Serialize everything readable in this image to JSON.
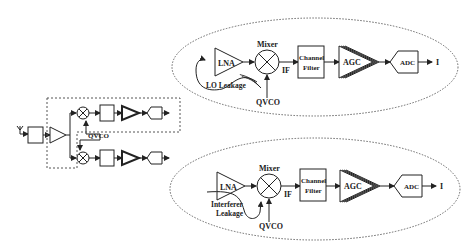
{
  "overview": {
    "vco_label": "QVCO"
  },
  "top_detail": {
    "lna_label": "LNA",
    "mixer_label": "Mixer",
    "if_label": "IF",
    "filter_label_1": "Channel",
    "filter_label_2": "Filter",
    "agc_label": "AGC",
    "adc_label": "ADC",
    "output_label": "I",
    "leakage_label": "LO Leakage",
    "vco_label": "QVCO"
  },
  "bottom_detail": {
    "lna_label": "LNA",
    "mixer_label": "Mixer",
    "if_label": "IF",
    "filter_label_1": "Channel",
    "filter_label_2": "Filter",
    "agc_label": "AGC",
    "adc_label": "ADC",
    "output_label": "I",
    "leakage_label_1": "Interferer",
    "leakage_label_2": "Leakage",
    "vco_label": "QVCO"
  },
  "colors": {
    "stroke": "#222222",
    "dashed": "#555555",
    "background": "#ffffff"
  }
}
